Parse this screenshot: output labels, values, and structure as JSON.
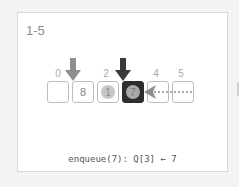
{
  "panel": {
    "label": "1-5",
    "caption": "enqueue(7): Q[3] ← 7"
  },
  "queue": {
    "indices": [
      "0",
      "",
      "2",
      "",
      "4",
      "5"
    ],
    "cells": [
      {
        "index": 0,
        "value": "",
        "style": "empty"
      },
      {
        "index": 1,
        "value": "8",
        "style": "plain"
      },
      {
        "index": 2,
        "value": "1",
        "style": "coin"
      },
      {
        "index": 3,
        "value": "7",
        "style": "active-coin"
      },
      {
        "index": 4,
        "value": "",
        "style": "empty"
      },
      {
        "index": 5,
        "value": "",
        "style": "empty"
      }
    ],
    "head_pointer": {
      "index": 1,
      "color": "#8f8f8f"
    },
    "tail_pointer": {
      "index": 3,
      "color": "#3a3a3a"
    },
    "incoming_arrow": {
      "from": 5,
      "to": 3,
      "style": "dotted",
      "color": "#8f8f8f"
    }
  },
  "colors": {
    "active_cell": "#2d2d2d",
    "coin": "#c6c6c6",
    "border": "#bdbdbd"
  }
}
